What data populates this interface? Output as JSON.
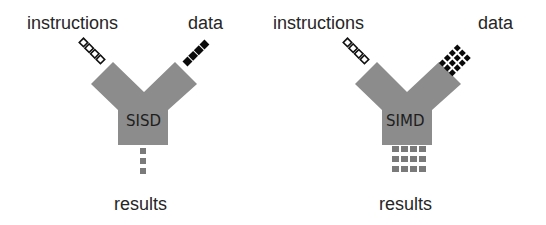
{
  "panels": [
    {
      "id": "sisd",
      "core_label": "SISD",
      "instructions_label": "instructions",
      "data_label": "data",
      "results_label": "results",
      "instruction_stream": {
        "style": "hollow-squares",
        "count": 4,
        "rows": 1
      },
      "data_stream": {
        "style": "filled-squares",
        "count": 4,
        "rows": 1
      },
      "results_stream": {
        "style": "gray-squares",
        "cols": 1,
        "rows": 3
      }
    },
    {
      "id": "simd",
      "core_label": "SIMD",
      "instructions_label": "instructions",
      "data_label": "data",
      "results_label": "results",
      "instruction_stream": {
        "style": "hollow-squares",
        "count": 4,
        "rows": 1
      },
      "data_stream": {
        "style": "filled-squares",
        "cols": 4,
        "rows": 3
      },
      "results_stream": {
        "style": "gray-squares",
        "cols": 4,
        "rows": 3
      }
    }
  ],
  "colors": {
    "core_fill": "#8c8c8c",
    "results_fill": "#7a7a7a",
    "data_fill": "#0a0a0a",
    "instruction_stroke": "#111111",
    "text": "#262626",
    "background": "#ffffff"
  }
}
